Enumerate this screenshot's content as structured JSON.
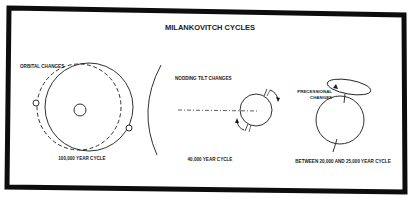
{
  "title": "MILANKOVITCH CYCLES",
  "panels": [
    {
      "id": "orbital",
      "label": "ORBITAL CHANGES",
      "cycle": "100,000 YEAR CYCLE"
    },
    {
      "id": "tilt",
      "label": "NODDING TILT CHANGES",
      "cycle": "40,000 YEAR CYCLE"
    },
    {
      "id": "precession",
      "label_line1": "PRECESSIONAL",
      "label_line2": "CHANGES",
      "cycle": "BETWEEN 20,000 AND 25,000 YEAR CYCLE"
    }
  ],
  "colors": {
    "ink": "#1a1a1a",
    "frame": "#0d0d0d",
    "background": "#ffffff"
  }
}
